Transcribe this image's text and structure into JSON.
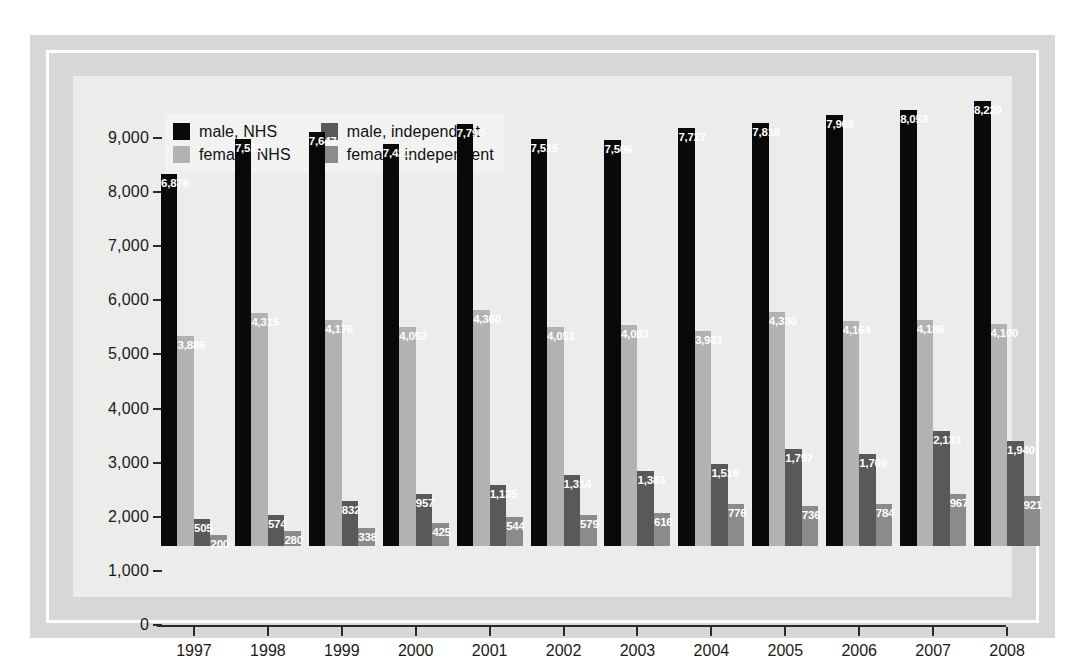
{
  "chart_data": {
    "type": "bar",
    "title": "",
    "subtitle": "",
    "xlabel": "",
    "ylabel": "",
    "ylim": [
      0,
      9000
    ],
    "ytick_labels": [
      "0",
      "1,000",
      "2,000",
      "3,000",
      "4,000",
      "5,000",
      "6,000",
      "7,000",
      "8,000",
      "9,000"
    ],
    "ytick_values": [
      0,
      1000,
      2000,
      3000,
      4000,
      5000,
      6000,
      7000,
      8000,
      9000
    ],
    "grid": false,
    "legend_position": "top-left",
    "categories": [
      "1997",
      "1998",
      "1999",
      "2000",
      "2001",
      "2002",
      "2003",
      "2004",
      "2005",
      "2006",
      "2007",
      "2008"
    ],
    "series": [
      {
        "name": "male, NHS",
        "color": "#090909",
        "values": [
          6878,
          7515,
          7647,
          7421,
          7790,
          7515,
          7506,
          7727,
          7818,
          7968,
          8053,
          8220
        ],
        "labels": [
          "6,878",
          "7,515",
          "7,647",
          "7,421",
          "7,790",
          "7,515",
          "7,506",
          "7,727",
          "7,818",
          "7,968",
          "8,053",
          "8,220"
        ]
      },
      {
        "name": "female, NHS",
        "color": "#b2b2b1",
        "values": [
          3886,
          4315,
          4176,
          4052,
          4360,
          4051,
          4083,
          3981,
          4330,
          4164,
          4186,
          4100
        ],
        "labels": [
          "3,886",
          "4,315",
          "4,176",
          "4,052",
          "4,360",
          "4,051",
          "4,083",
          "3,981",
          "4,330",
          "4,164",
          "4,186",
          "4,100"
        ]
      },
      {
        "name": "male, independent",
        "color": "#59595a",
        "values": [
          505,
          574,
          832,
          957,
          1135,
          1314,
          1383,
          1516,
          1797,
          1709,
          2133,
          1940
        ],
        "labels": [
          "505",
          "574",
          "832",
          "957",
          "1,135",
          "1,314",
          "1,383",
          "1,516",
          "1,797",
          "1,709",
          "2,133",
          "1,940"
        ]
      },
      {
        "name": "female, independent",
        "color": "#8b8b8b",
        "values": [
          200,
          280,
          338,
          425,
          544,
          579,
          616,
          776,
          736,
          784,
          967,
          921
        ],
        "labels": [
          "200",
          "280",
          "338",
          "425",
          "544",
          "579",
          "616",
          "776",
          "736",
          "784",
          "967",
          "921"
        ]
      }
    ]
  },
  "legend": {
    "items": [
      {
        "label": "male, NHS",
        "swatch": "#090909",
        "name": "legend-swatch-male-nhs"
      },
      {
        "label": "male, independent",
        "swatch": "#59595a",
        "name": "legend-swatch-male-independent"
      },
      {
        "label": "female, NHS",
        "swatch": "#b2b2b1",
        "name": "legend-swatch-female-nhs"
      },
      {
        "label": "female, independent",
        "swatch": "#8b8b8b",
        "name": "legend-swatch-female-independent"
      }
    ]
  },
  "frame": {
    "outer_color": "#d7d7d7",
    "inner_rule_color": "#ffffff",
    "plot_background": "#ececeb"
  }
}
